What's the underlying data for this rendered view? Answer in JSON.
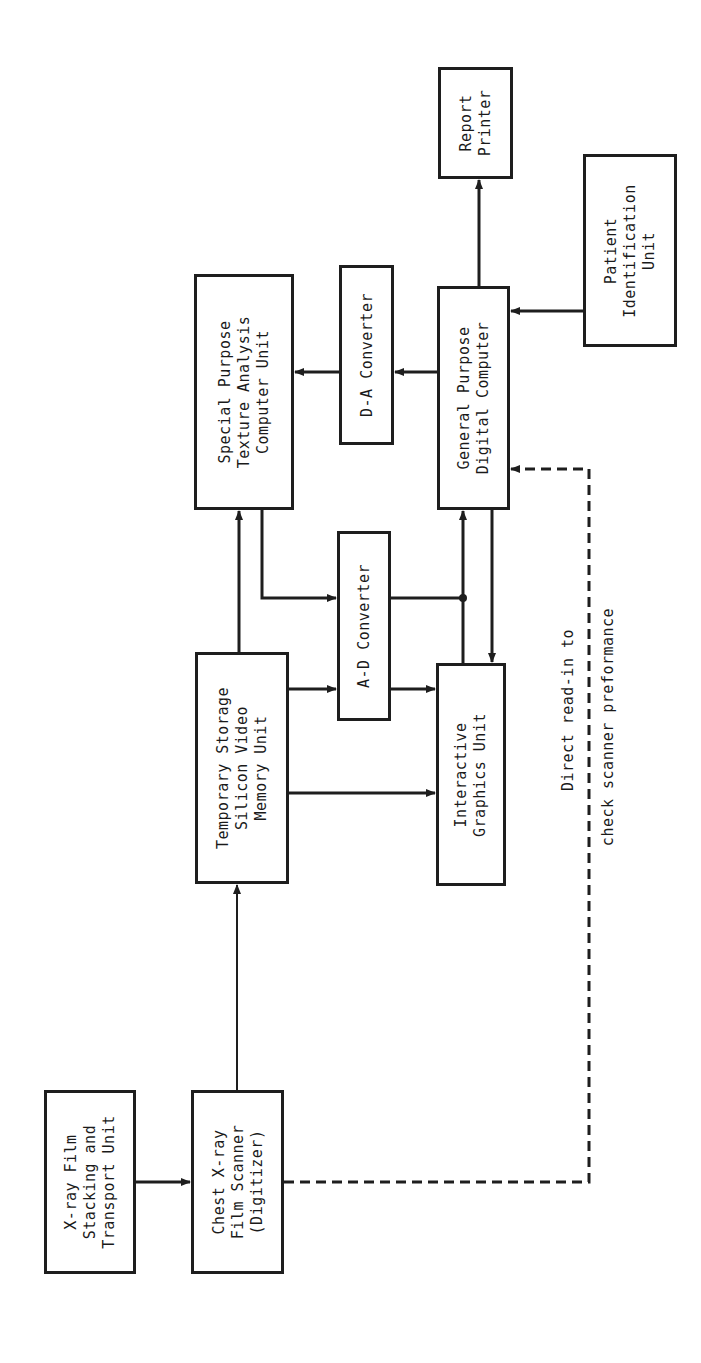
{
  "diagram": {
    "orientation": "rotated 90 degrees counter-clockwise",
    "colors": {
      "line": "#1e1e1e",
      "background": "#ffffff"
    },
    "boxes": {
      "xray_stacking": {
        "label": "X-ray Film\nStacking and\nTransport Unit"
      },
      "chest_scanner": {
        "label": "Chest X-ray\nFilm Scanner\n(Digitizer)"
      },
      "temp_storage": {
        "label": "Temporary Storage\nSilicon Video\nMemory Unit"
      },
      "texture_analysis": {
        "label": "Special Purpose\nTexture Analysis\nComputer Unit"
      },
      "ad_converter": {
        "label": "A-D Converter"
      },
      "da_converter": {
        "label": "D-A Converter"
      },
      "interactive_graphics": {
        "label": "Interactive\nGraphics Unit"
      },
      "general_computer": {
        "label": "General Purpose\nDigital Computer"
      },
      "report_printer": {
        "label": "Report\nPrinter"
      },
      "patient_id": {
        "label": "Patient\nIdentification\nUnit"
      }
    },
    "annotation": {
      "line1": "Direct read-in to",
      "line2": "check scanner preformance"
    },
    "connections": [
      {
        "from": "X-ray Film Stacking and Transport Unit",
        "to": "Chest X-ray Film Scanner (Digitizer)",
        "style": "solid"
      },
      {
        "from": "Chest X-ray Film Scanner (Digitizer)",
        "to": "Temporary Storage Silicon Video Memory Unit",
        "style": "solid"
      },
      {
        "from": "Temporary Storage Silicon Video Memory Unit",
        "to": "Special Purpose Texture Analysis Computer Unit",
        "style": "solid"
      },
      {
        "from": "Temporary Storage Silicon Video Memory Unit",
        "to": "A-D Converter",
        "style": "solid"
      },
      {
        "from": "Temporary Storage Silicon Video Memory Unit",
        "to": "Interactive Graphics Unit",
        "style": "solid"
      },
      {
        "from": "Special Purpose Texture Analysis Computer Unit",
        "to": "A-D Converter",
        "style": "solid"
      },
      {
        "from": "A-D Converter",
        "to": "Interactive Graphics Unit",
        "style": "solid"
      },
      {
        "from": "A-D Converter",
        "to": "General Purpose Digital Computer",
        "style": "solid"
      },
      {
        "from": "Interactive Graphics Unit",
        "to": "General Purpose Digital Computer",
        "style": "solid"
      },
      {
        "from": "General Purpose Digital Computer",
        "to": "Interactive Graphics Unit",
        "style": "solid"
      },
      {
        "from": "General Purpose Digital Computer",
        "to": "D-A Converter",
        "style": "solid"
      },
      {
        "from": "D-A Converter",
        "to": "Special Purpose Texture Analysis Computer Unit",
        "style": "solid"
      },
      {
        "from": "General Purpose Digital Computer",
        "to": "Report Printer",
        "style": "solid"
      },
      {
        "from": "Patient Identification Unit",
        "to": "General Purpose Digital Computer",
        "style": "solid"
      },
      {
        "from": "Chest X-ray Film Scanner (Digitizer)",
        "to": "General Purpose Digital Computer",
        "style": "dashed",
        "label": "Direct read-in to check scanner preformance"
      }
    ]
  }
}
